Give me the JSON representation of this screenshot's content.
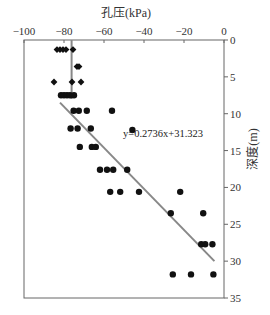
{
  "chart_data": {
    "type": "scatter",
    "title": "孔压(kPa)",
    "xlabel": "孔压(kPa)",
    "ylabel": "深度(m)",
    "x_axis_position": "top",
    "y_axis_position": "right",
    "y_inverted": true,
    "xlim": [
      -100,
      0
    ],
    "ylim": [
      0,
      35
    ],
    "x_ticks": [
      -100,
      -80,
      -60,
      -40,
      -20,
      0
    ],
    "y_ticks": [
      0,
      5,
      10,
      15,
      20,
      25,
      30,
      35
    ],
    "grid": false,
    "legend": null,
    "series": [
      {
        "name": "shallow (diamond markers)",
        "marker": "diamond",
        "color": "#111111",
        "points": [
          {
            "x": -83.5,
            "y": 1.3
          },
          {
            "x": -82.0,
            "y": 1.3
          },
          {
            "x": -80.5,
            "y": 1.3
          },
          {
            "x": -79.0,
            "y": 1.3
          },
          {
            "x": -75.5,
            "y": 1.3
          },
          {
            "x": -73.5,
            "y": 3.6
          },
          {
            "x": -72.5,
            "y": 3.6
          },
          {
            "x": -85.0,
            "y": 5.7
          },
          {
            "x": -76.0,
            "y": 5.7
          },
          {
            "x": -71.5,
            "y": 5.7
          }
        ]
      },
      {
        "name": "deep (circle markers)",
        "marker": "circle",
        "color": "#111111",
        "points": [
          {
            "x": -81.5,
            "y": 7.5
          },
          {
            "x": -80.0,
            "y": 7.5
          },
          {
            "x": -78.5,
            "y": 7.5
          },
          {
            "x": -77.0,
            "y": 7.5
          },
          {
            "x": -75.0,
            "y": 7.5
          },
          {
            "x": -75.2,
            "y": 9.6
          },
          {
            "x": -72.6,
            "y": 9.6
          },
          {
            "x": -68.6,
            "y": 9.6
          },
          {
            "x": -56.0,
            "y": 9.6
          },
          {
            "x": -76.7,
            "y": 12.0
          },
          {
            "x": -73.2,
            "y": 12.0
          },
          {
            "x": -66.6,
            "y": 12.0
          },
          {
            "x": -45.8,
            "y": 12.2
          },
          {
            "x": -72.1,
            "y": 14.5
          },
          {
            "x": -66.1,
            "y": 14.5
          },
          {
            "x": -64.1,
            "y": 14.5
          },
          {
            "x": -62.0,
            "y": 17.6
          },
          {
            "x": -58.5,
            "y": 17.6
          },
          {
            "x": -55.4,
            "y": 17.6
          },
          {
            "x": -48.4,
            "y": 17.6
          },
          {
            "x": -56.9,
            "y": 20.6
          },
          {
            "x": -51.9,
            "y": 20.6
          },
          {
            "x": -42.5,
            "y": 20.6
          },
          {
            "x": -21.9,
            "y": 20.6
          },
          {
            "x": -26.6,
            "y": 23.5
          },
          {
            "x": -10.4,
            "y": 23.5
          },
          {
            "x": -11.4,
            "y": 27.7
          },
          {
            "x": -9.4,
            "y": 27.7
          },
          {
            "x": -5.8,
            "y": 27.7
          },
          {
            "x": -25.6,
            "y": 31.8
          },
          {
            "x": -16.5,
            "y": 31.8
          },
          {
            "x": -5.3,
            "y": 31.8
          }
        ]
      }
    ],
    "reference_lines": [
      {
        "name": "vertical mean line",
        "type": "vertical",
        "x": -76.2,
        "y_from": 0,
        "y_to": 8.0,
        "color": "#888888"
      },
      {
        "name": "regression line",
        "type": "linear",
        "equation": "y=0.2736x+31.323",
        "from": {
          "x": -82.0,
          "y": 8.5
        },
        "to": {
          "x": -4.8,
          "y": 30.0
        },
        "color": "#888888"
      }
    ],
    "annotations": [
      {
        "text": "y=0.2736x+31.323",
        "x": -50.5,
        "y": 13.1
      }
    ]
  }
}
